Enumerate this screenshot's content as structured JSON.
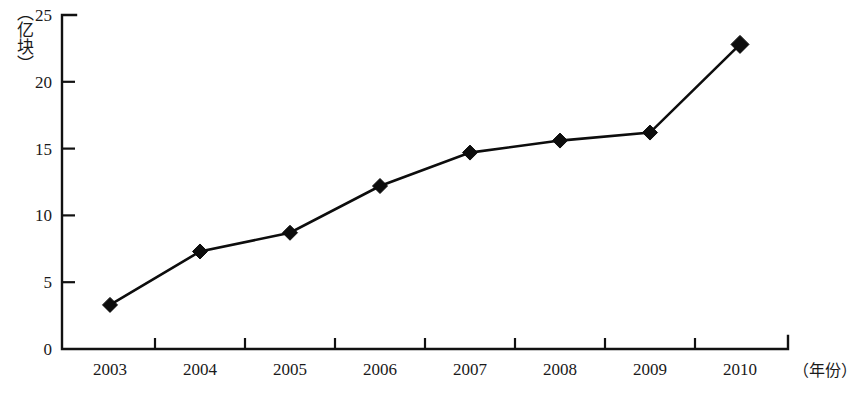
{
  "chart_data": {
    "type": "line",
    "title": "",
    "xlabel": "（年份）",
    "ylabel": "（亿块）",
    "categories": [
      "2003",
      "2004",
      "2005",
      "2006",
      "2007",
      "2008",
      "2009",
      "2010"
    ],
    "values": [
      3.3,
      7.3,
      8.7,
      12.2,
      14.7,
      15.6,
      16.2,
      22.8
    ],
    "series": [
      {
        "name": "",
        "values": [
          3.3,
          7.3,
          8.7,
          12.2,
          14.7,
          15.6,
          16.2,
          22.8
        ]
      }
    ],
    "ylim": [
      0,
      25
    ],
    "yticks": [
      "0",
      "5",
      "10",
      "15",
      "20",
      "25"
    ],
    "ytick_values": [
      0,
      5,
      10,
      15,
      20,
      25
    ],
    "grid": "off",
    "legend": "none",
    "marker": "diamond",
    "line_color": "#0d0d0d",
    "marker_color": "#0d0d0d",
    "axis_color": "#111111"
  },
  "axis": {
    "y_unit": "（亿块）",
    "x_unit": "（年份）"
  }
}
